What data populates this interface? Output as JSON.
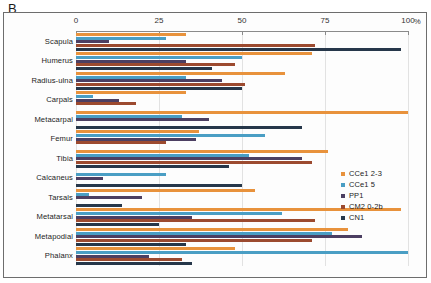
{
  "panel": {
    "letter": "B"
  },
  "axis": {
    "unit": "%",
    "ticks": [
      {
        "value": 0,
        "label": "0"
      },
      {
        "value": 25,
        "label": "25"
      },
      {
        "value": 50,
        "label": "50"
      },
      {
        "value": 75,
        "label": "75"
      },
      {
        "value": 100,
        "label": "100"
      }
    ]
  },
  "legend": [
    {
      "label": "CCe1 2-3",
      "color": "#e8923c"
    },
    {
      "label": "CCe1 5",
      "color": "#4a9ec4"
    },
    {
      "label": "PP1",
      "color": "#4c3f62"
    },
    {
      "label": "CM2 0-2b",
      "color": "#9c4a2f"
    },
    {
      "label": "CN1",
      "color": "#26374a"
    }
  ],
  "chart_data": {
    "type": "bar",
    "orientation": "horizontal",
    "title": "B",
    "xlabel": "%",
    "ylabel": "",
    "xlim": [
      0,
      100
    ],
    "grid": true,
    "legend_position": "right",
    "categories": [
      "Scapula",
      "Humerus",
      "Radius-ulna",
      "Carpals",
      "Metacarpal",
      "Femur",
      "Tibia",
      "Calcaneus",
      "Tarsals",
      "Metatarsal",
      "Metapodial",
      "Phalanx"
    ],
    "series": [
      {
        "name": "CCe1 2-3",
        "color": "#e8923c",
        "values": [
          33,
          71,
          63,
          33,
          100,
          37,
          76,
          0,
          54,
          98,
          82,
          48
        ]
      },
      {
        "name": "CCe1 5",
        "color": "#4a9ec4",
        "values": [
          27,
          50,
          33,
          5,
          32,
          57,
          52,
          27,
          4,
          62,
          77,
          100
        ]
      },
      {
        "name": "PP1",
        "color": "#4c3f62",
        "values": [
          10,
          33,
          44,
          13,
          40,
          36,
          68,
          8,
          20,
          35,
          86,
          22
        ]
      },
      {
        "name": "CM2 0-2b",
        "color": "#9c4a2f",
        "values": [
          72,
          48,
          51,
          18,
          0,
          27,
          71,
          0,
          0,
          72,
          71,
          32
        ]
      },
      {
        "name": "CN1",
        "color": "#26374a",
        "values": [
          98,
          41,
          50,
          0,
          68,
          0,
          46,
          50,
          14,
          25,
          33,
          35
        ]
      }
    ]
  }
}
